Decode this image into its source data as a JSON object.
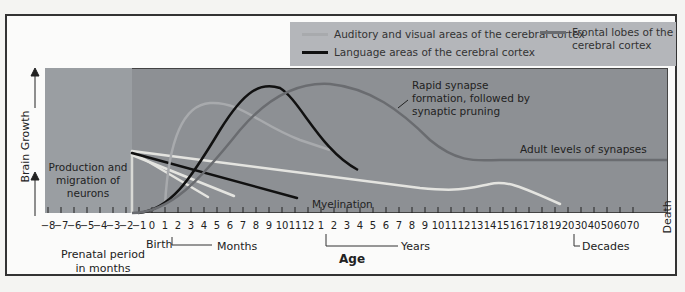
{
  "legend": {
    "items": [
      {
        "label": "Auditory and visual areas of the cerebral cortex",
        "color": "#a8aaad"
      },
      {
        "label": "Language areas of the cerebral cortex",
        "color": "#111111"
      },
      {
        "label": "Frontal lobes of the cerebral cortex",
        "color": "#6a6c70"
      }
    ]
  },
  "y_axis": {
    "label": "Brain Growth"
  },
  "annotations": {
    "neurons": "Production and migration of neurons",
    "synapse": "Rapid synapse formation, followed by synaptic pruning",
    "adult": "Adult levels of synapses",
    "myelination": "Myelination"
  },
  "x_axis": {
    "title": "Age",
    "prenatal_label": "Prenatal period in months",
    "birth_label": "Birth",
    "months_label": "Months",
    "years_label": "Years",
    "decades_label": "Decades",
    "death_label": "Death",
    "ticks": [
      "-8",
      "-7",
      "-6",
      "-5",
      "-4",
      "-3",
      "-2",
      "-1",
      "0",
      "1",
      "2",
      "3",
      "4",
      "5",
      "6",
      "7",
      "8",
      "9",
      "10",
      "11",
      "12",
      "1",
      "2",
      "3",
      "4",
      "5",
      "6",
      "7",
      "8",
      "9",
      "10",
      "11",
      "12",
      "13",
      "14",
      "15",
      "16",
      "17",
      "18",
      "19",
      "20",
      "30",
      "40",
      "50",
      "60",
      "70"
    ]
  },
  "colors": {
    "plot_bg": "#8d9094",
    "prenatal_bg": "#9a9ea2",
    "legend_bg": "#b4b6ba",
    "myelination": "#e8e8e4",
    "auditory_visual": "#a8aaad",
    "language": "#111111",
    "frontal": "#6a6c70"
  },
  "chart_data": {
    "type": "line",
    "xlabel": "Age",
    "ylabel": "Brain Growth",
    "series": [
      {
        "name": "Auditory and visual areas of the cerebral cortex",
        "peak_at": "~4 months"
      },
      {
        "name": "Language areas of the cerebral cortex",
        "peak_at": "~9 months"
      },
      {
        "name": "Frontal lobes of the cerebral cortex",
        "peak_at": "~1-2 years",
        "plateau": "Adult levels of synapses"
      },
      {
        "name": "Myelination",
        "span": "prenatal -2 months through ~20 years"
      }
    ]
  }
}
